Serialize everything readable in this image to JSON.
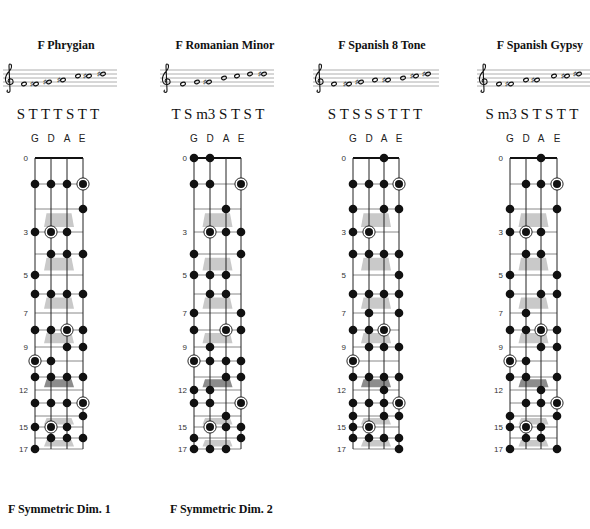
{
  "colors": {
    "ink": "#111111",
    "string": "#222222",
    "fret": "#7a7a7a",
    "staff_line": "#9a9a9a",
    "marker": "#c9c9c9",
    "marker_double": "#8c8c8c",
    "background": "#ffffff"
  },
  "fret_labels": [
    {
      "fret": 0,
      "label": "0"
    },
    {
      "fret": 3,
      "label": "3"
    },
    {
      "fret": 5,
      "label": "5"
    },
    {
      "fret": 7,
      "label": "7"
    },
    {
      "fret": 9,
      "label": "9"
    },
    {
      "fret": 12,
      "label": "12"
    },
    {
      "fret": 15,
      "label": "15"
    },
    {
      "fret": 17,
      "label": "17"
    }
  ],
  "fret_markers": [
    3,
    5,
    7,
    9,
    12,
    15,
    17
  ],
  "double_marker": 12,
  "last_fret": 17,
  "icons": {
    "clef": "treble-clef-icon",
    "note": "whole-note-icon",
    "sharp": "sharp-icon",
    "dot": "finger-dot-icon",
    "root": "root-ring-icon"
  },
  "scales": [
    {
      "title": "F Phrygian",
      "steps": "S T T T S T T",
      "notes": [
        {
          "pos": 1,
          "acc": ""
        },
        {
          "pos": 1,
          "acc": "#"
        },
        {
          "pos": 2,
          "acc": "#"
        },
        {
          "pos": 3,
          "acc": "#"
        },
        {
          "pos": 5,
          "acc": ""
        },
        {
          "pos": 5,
          "acc": "#"
        },
        {
          "pos": 6,
          "acc": "#"
        }
      ],
      "fretboard": [
        {
          "string": "G",
          "dots": [
            1,
            3,
            5,
            6,
            8,
            10,
            11,
            13,
            15,
            17
          ],
          "roots": [
            10
          ]
        },
        {
          "string": "D",
          "dots": [
            1,
            3,
            4,
            6,
            8,
            10,
            11,
            13,
            15,
            16
          ],
          "roots": [
            3,
            15
          ]
        },
        {
          "string": "A",
          "dots": [
            1,
            3,
            4,
            6,
            8,
            9,
            11,
            13,
            15,
            16
          ],
          "roots": [
            8
          ]
        },
        {
          "string": "E",
          "dots": [
            1,
            2,
            4,
            6,
            8,
            9,
            11,
            13,
            14,
            16
          ],
          "roots": [
            1,
            13
          ]
        }
      ]
    },
    {
      "title": "F Romanian Minor",
      "steps": "T S m3 S T S T",
      "notes": [
        {
          "pos": 1,
          "acc": ""
        },
        {
          "pos": 2,
          "acc": ""
        },
        {
          "pos": 2,
          "acc": "#"
        },
        {
          "pos": 4,
          "acc": ""
        },
        {
          "pos": 5,
          "acc": ""
        },
        {
          "pos": 6,
          "acc": ""
        },
        {
          "pos": 6,
          "acc": "#"
        }
      ],
      "fretboard": [
        {
          "string": "G",
          "dots": [
            0,
            1,
            4,
            5,
            7,
            8,
            10,
            12,
            13,
            16,
            17
          ],
          "roots": [
            10
          ]
        },
        {
          "string": "D",
          "dots": [
            0,
            1,
            3,
            5,
            6,
            9,
            10,
            12,
            13,
            15,
            17
          ],
          "roots": [
            3,
            15
          ]
        },
        {
          "string": "A",
          "dots": [
            2,
            3,
            5,
            6,
            8,
            10,
            11,
            14,
            15,
            17
          ],
          "roots": [
            8
          ]
        },
        {
          "string": "E",
          "dots": [
            1,
            3,
            4,
            7,
            8,
            10,
            11,
            13,
            15,
            16
          ],
          "roots": [
            1,
            13
          ]
        }
      ]
    },
    {
      "title": "F Spanish 8 Tone",
      "steps": "S T S S S T T T",
      "notes": [
        {
          "pos": 1,
          "acc": ""
        },
        {
          "pos": 1,
          "acc": "#"
        },
        {
          "pos": 2,
          "acc": "#"
        },
        {
          "pos": 3,
          "acc": ""
        },
        {
          "pos": 3,
          "acc": "#"
        },
        {
          "pos": 4,
          "acc": ""
        },
        {
          "pos": 5,
          "acc": "#"
        },
        {
          "pos": 6,
          "acc": "#"
        }
      ],
      "fretboard": [
        {
          "string": "G",
          "dots": [
            1,
            2,
            3,
            4,
            6,
            8,
            10,
            11,
            13,
            14,
            15,
            16
          ],
          "roots": [
            10
          ]
        },
        {
          "string": "D",
          "dots": [
            1,
            3,
            4,
            6,
            7,
            8,
            9,
            11,
            13,
            15,
            16
          ],
          "roots": [
            3,
            15
          ]
        },
        {
          "string": "A",
          "dots": [
            0,
            1,
            2,
            4,
            6,
            8,
            9,
            11,
            12,
            13,
            14,
            16
          ],
          "roots": [
            8
          ]
        },
        {
          "string": "E",
          "dots": [
            1,
            2,
            4,
            5,
            6,
            7,
            9,
            11,
            13,
            14,
            16,
            17
          ],
          "roots": [
            1,
            13
          ]
        }
      ]
    },
    {
      "title": "F Spanish Gypsy",
      "steps": "S m3 S T S T T",
      "notes": [
        {
          "pos": 1,
          "acc": ""
        },
        {
          "pos": 1,
          "acc": "#"
        },
        {
          "pos": 3,
          "acc": ""
        },
        {
          "pos": 3,
          "acc": "#"
        },
        {
          "pos": 5,
          "acc": ""
        },
        {
          "pos": 5,
          "acc": "#"
        },
        {
          "pos": 6,
          "acc": "#"
        }
      ],
      "fretboard": [
        {
          "string": "G",
          "dots": [
            2,
            3,
            5,
            6,
            8,
            10,
            11,
            14,
            15,
            17
          ],
          "roots": [
            10
          ]
        },
        {
          "string": "D",
          "dots": [
            1,
            3,
            4,
            7,
            8,
            10,
            11,
            13,
            15,
            16
          ],
          "roots": [
            3,
            15
          ]
        },
        {
          "string": "A",
          "dots": [
            0,
            1,
            3,
            4,
            6,
            8,
            9,
            12,
            13,
            15,
            16
          ],
          "roots": [
            8
          ]
        },
        {
          "string": "E",
          "dots": [
            1,
            2,
            5,
            6,
            8,
            9,
            11,
            13,
            14,
            17
          ],
          "roots": [
            1,
            13
          ]
        }
      ]
    }
  ],
  "next_row_titles": [
    "F Symmetric Dim. 1",
    "F Symmetric Dim. 2"
  ]
}
